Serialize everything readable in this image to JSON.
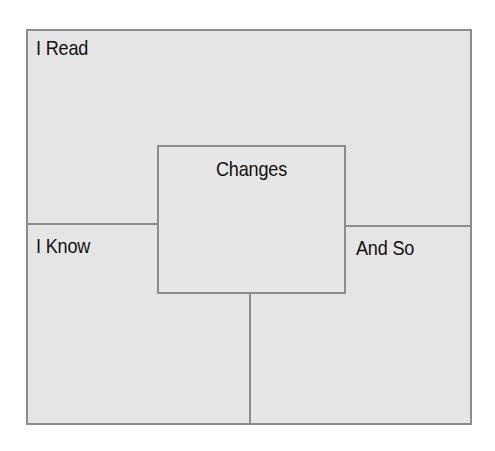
{
  "diagram": {
    "type": "reading-inference-organizer",
    "sections": {
      "top": "I Read",
      "left": "I Know",
      "right": "And So",
      "center": "Changes"
    },
    "colors": {
      "fill": "#e5e5e5",
      "border": "#8c8c8c",
      "text": "#111111"
    }
  }
}
